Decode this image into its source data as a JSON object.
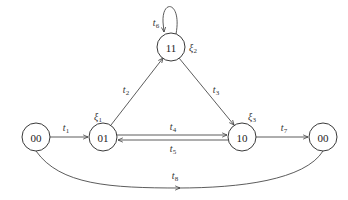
{
  "diagram": {
    "nodes": [
      {
        "id": "n00a",
        "label": "00",
        "x": 36,
        "y": 137
      },
      {
        "id": "n01",
        "label": "01",
        "x": 103,
        "y": 137,
        "annotation": {
          "base": "ξ",
          "sub": "1"
        }
      },
      {
        "id": "n11",
        "label": "11",
        "x": 171,
        "y": 47,
        "annotation": {
          "base": "ξ",
          "sub": "2"
        }
      },
      {
        "id": "n10",
        "label": "10",
        "x": 242,
        "y": 137,
        "annotation": {
          "base": "ξ",
          "sub": "3"
        }
      },
      {
        "id": "n00b",
        "label": "00",
        "x": 323,
        "y": 137
      }
    ],
    "edges": [
      {
        "id": "t1",
        "base": "t",
        "sub": "1",
        "from": "00",
        "to": "01"
      },
      {
        "id": "t2",
        "base": "t",
        "sub": "2",
        "from": "01",
        "to": "11"
      },
      {
        "id": "t3",
        "base": "t",
        "sub": "3",
        "from": "11",
        "to": "10"
      },
      {
        "id": "t4",
        "base": "t",
        "sub": "4",
        "from": "01",
        "to": "10"
      },
      {
        "id": "t5",
        "base": "t",
        "sub": "5",
        "from": "10",
        "to": "01"
      },
      {
        "id": "t6",
        "base": "t",
        "sub": "6",
        "from": "11",
        "to": "11"
      },
      {
        "id": "t7",
        "base": "t",
        "sub": "7",
        "from": "10",
        "to": "00"
      },
      {
        "id": "t8",
        "base": "t",
        "sub": "8",
        "from": "00",
        "to": "00"
      }
    ]
  }
}
